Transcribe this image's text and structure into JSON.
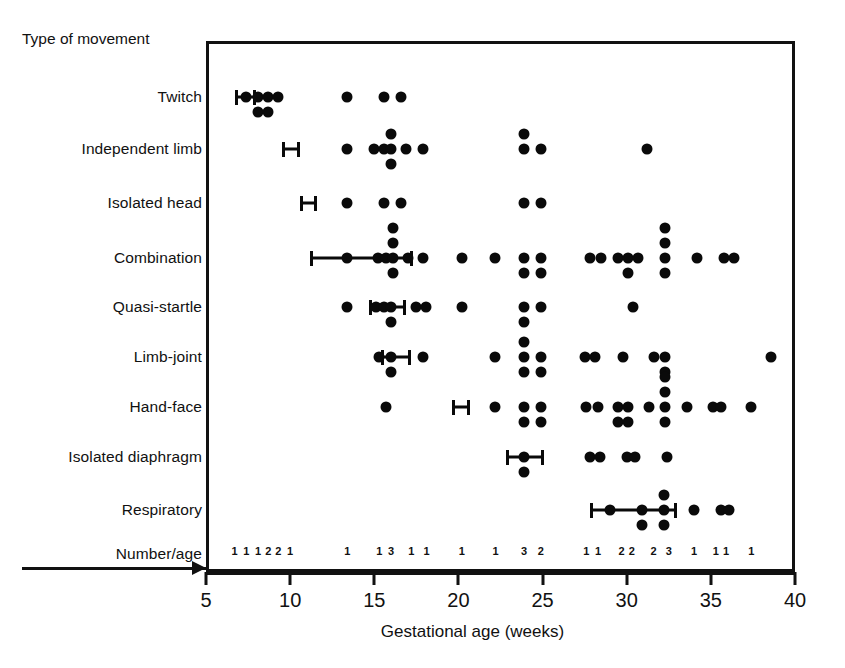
{
  "figure": {
    "column_header": "Type of movement",
    "numberage_label": "Number/age",
    "x_axis_title": "Gestational age (weeks)"
  },
  "chart_data": {
    "type": "scatter",
    "title": "",
    "xlabel": "Gestational age (weeks)",
    "ylabel": "Type of movement",
    "xlim": [
      5,
      40
    ],
    "xticks": [
      5,
      10,
      15,
      20,
      25,
      30,
      35,
      40
    ],
    "xticklabels": [
      "5",
      "10",
      "15",
      "20",
      "25",
      "30",
      "35",
      "40"
    ],
    "grid": false,
    "legend": null,
    "categories": [
      "Twitch",
      "Independent limb",
      "Isolated head",
      "Combination",
      "Quasi-startle",
      "Limb-joint",
      "Hand-face",
      "Isolated diaphragm",
      "Respiratory"
    ],
    "series": [
      {
        "name": "Twitch",
        "error_bar": {
          "low": 6.7,
          "high": 8.0,
          "mean": 7.4
        },
        "points": [
          {
            "x": 7.4,
            "stack": 0
          },
          {
            "x": 8.1,
            "stack": 0
          },
          {
            "x": 8.1,
            "stack": 1
          },
          {
            "x": 8.7,
            "stack": 0
          },
          {
            "x": 8.7,
            "stack": 1
          },
          {
            "x": 9.3,
            "stack": 0
          },
          {
            "x": 13.4,
            "stack": 0
          },
          {
            "x": 15.6,
            "stack": 0
          },
          {
            "x": 16.6,
            "stack": 0
          }
        ]
      },
      {
        "name": "Independent limb",
        "error_bar": {
          "low": 9.5,
          "high": 10.6,
          "mean": 10.0
        },
        "points": [
          {
            "x": 13.4,
            "stack": 0
          },
          {
            "x": 15.0,
            "stack": 0
          },
          {
            "x": 15.6,
            "stack": 0
          },
          {
            "x": 16.0,
            "stack": 0
          },
          {
            "x": 16.0,
            "stack": 1
          },
          {
            "x": 16.0,
            "stack": -1
          },
          {
            "x": 16.9,
            "stack": 0
          },
          {
            "x": 17.9,
            "stack": 0
          },
          {
            "x": 23.9,
            "stack": 0
          },
          {
            "x": 23.9,
            "stack": -1
          },
          {
            "x": 24.9,
            "stack": 0
          },
          {
            "x": 31.2,
            "stack": 0
          }
        ]
      },
      {
        "name": "Isolated head",
        "error_bar": {
          "low": 10.6,
          "high": 11.6,
          "mean": 11.1
        },
        "points": [
          {
            "x": 13.4,
            "stack": 0
          },
          {
            "x": 15.6,
            "stack": 0
          },
          {
            "x": 16.6,
            "stack": 0
          },
          {
            "x": 23.9,
            "stack": 0
          },
          {
            "x": 24.9,
            "stack": 0
          }
        ]
      },
      {
        "name": "Combination",
        "error_bar": {
          "low": 11.2,
          "high": 17.3,
          "mean": 13.9
        },
        "points": [
          {
            "x": 13.4,
            "stack": 0
          },
          {
            "x": 15.2,
            "stack": 0
          },
          {
            "x": 15.7,
            "stack": 0
          },
          {
            "x": 16.1,
            "stack": 0
          },
          {
            "x": 16.1,
            "stack": -1
          },
          {
            "x": 16.1,
            "stack": 1
          },
          {
            "x": 16.1,
            "stack": -2
          },
          {
            "x": 17.0,
            "stack": 0
          },
          {
            "x": 17.9,
            "stack": 0
          },
          {
            "x": 20.2,
            "stack": 0
          },
          {
            "x": 22.2,
            "stack": 0
          },
          {
            "x": 23.9,
            "stack": 0
          },
          {
            "x": 23.9,
            "stack": 1
          },
          {
            "x": 24.9,
            "stack": 0
          },
          {
            "x": 24.9,
            "stack": 1
          },
          {
            "x": 27.8,
            "stack": 0
          },
          {
            "x": 28.5,
            "stack": 0
          },
          {
            "x": 29.5,
            "stack": 0
          },
          {
            "x": 30.1,
            "stack": 0
          },
          {
            "x": 30.1,
            "stack": 1
          },
          {
            "x": 30.7,
            "stack": 0
          },
          {
            "x": 32.3,
            "stack": 0
          },
          {
            "x": 32.3,
            "stack": 1
          },
          {
            "x": 32.3,
            "stack": -1
          },
          {
            "x": 32.3,
            "stack": -2
          },
          {
            "x": 34.2,
            "stack": 0
          },
          {
            "x": 35.8,
            "stack": 0
          },
          {
            "x": 36.4,
            "stack": 0
          }
        ]
      },
      {
        "name": "Quasi-startle",
        "error_bar": {
          "low": 14.7,
          "high": 16.9,
          "mean": 15.7
        },
        "points": [
          {
            "x": 13.4,
            "stack": 0
          },
          {
            "x": 15.1,
            "stack": 0
          },
          {
            "x": 15.6,
            "stack": 0
          },
          {
            "x": 16.0,
            "stack": 0
          },
          {
            "x": 16.0,
            "stack": 1
          },
          {
            "x": 17.5,
            "stack": 0
          },
          {
            "x": 18.1,
            "stack": 0
          },
          {
            "x": 20.2,
            "stack": 0
          },
          {
            "x": 23.9,
            "stack": 0
          },
          {
            "x": 23.9,
            "stack": 1
          },
          {
            "x": 24.9,
            "stack": 0
          },
          {
            "x": 30.4,
            "stack": 0
          }
        ]
      },
      {
        "name": "Limb-joint",
        "error_bar": {
          "low": 15.4,
          "high": 17.2,
          "mean": 16.1
        },
        "points": [
          {
            "x": 15.3,
            "stack": 0
          },
          {
            "x": 16.0,
            "stack": 0
          },
          {
            "x": 16.0,
            "stack": 1
          },
          {
            "x": 17.9,
            "stack": 0
          },
          {
            "x": 22.2,
            "stack": 0
          },
          {
            "x": 23.9,
            "stack": 0
          },
          {
            "x": 23.9,
            "stack": 1
          },
          {
            "x": 23.9,
            "stack": -1
          },
          {
            "x": 24.9,
            "stack": 0
          },
          {
            "x": 24.9,
            "stack": 1
          },
          {
            "x": 27.5,
            "stack": 0
          },
          {
            "x": 28.1,
            "stack": 0
          },
          {
            "x": 29.8,
            "stack": 0
          },
          {
            "x": 31.6,
            "stack": 0
          },
          {
            "x": 32.3,
            "stack": 0
          },
          {
            "x": 32.3,
            "stack": 1
          },
          {
            "x": 38.6,
            "stack": 0
          }
        ]
      },
      {
        "name": "Hand-face",
        "error_bar": {
          "low": 19.6,
          "high": 20.7,
          "mean": 20.1
        },
        "points": [
          {
            "x": 15.7,
            "stack": 0
          },
          {
            "x": 22.2,
            "stack": 0
          },
          {
            "x": 23.9,
            "stack": 0
          },
          {
            "x": 23.9,
            "stack": 1
          },
          {
            "x": 24.9,
            "stack": 0
          },
          {
            "x": 24.9,
            "stack": 1
          },
          {
            "x": 27.6,
            "stack": 0
          },
          {
            "x": 28.3,
            "stack": 0
          },
          {
            "x": 29.5,
            "stack": 0
          },
          {
            "x": 29.5,
            "stack": 1
          },
          {
            "x": 30.1,
            "stack": 0
          },
          {
            "x": 30.1,
            "stack": 1
          },
          {
            "x": 31.3,
            "stack": 0
          },
          {
            "x": 32.3,
            "stack": 0
          },
          {
            "x": 32.3,
            "stack": 1
          },
          {
            "x": 32.3,
            "stack": -1
          },
          {
            "x": 32.3,
            "stack": -2
          },
          {
            "x": 33.6,
            "stack": 0
          },
          {
            "x": 35.1,
            "stack": 0
          },
          {
            "x": 35.6,
            "stack": 0
          },
          {
            "x": 37.4,
            "stack": 0
          }
        ]
      },
      {
        "name": "Isolated diaphragm",
        "error_bar": {
          "low": 22.8,
          "high": 25.1,
          "mean": 23.9
        },
        "points": [
          {
            "x": 23.9,
            "stack": 1
          },
          {
            "x": 23.9,
            "stack": 0
          },
          {
            "x": 27.8,
            "stack": 0
          },
          {
            "x": 28.4,
            "stack": 0
          },
          {
            "x": 30.0,
            "stack": 0
          },
          {
            "x": 30.5,
            "stack": 0
          },
          {
            "x": 32.4,
            "stack": 0
          }
        ]
      },
      {
        "name": "Respiratory",
        "error_bar": {
          "low": 27.8,
          "high": 33.0,
          "mean": 30.4
        },
        "points": [
          {
            "x": 29.0,
            "stack": 0
          },
          {
            "x": 30.9,
            "stack": 0
          },
          {
            "x": 30.9,
            "stack": 1
          },
          {
            "x": 32.2,
            "stack": 0
          },
          {
            "x": 32.2,
            "stack": 1
          },
          {
            "x": 32.2,
            "stack": -1
          },
          {
            "x": 34.0,
            "stack": 0
          },
          {
            "x": 35.6,
            "stack": 0
          },
          {
            "x": 36.1,
            "stack": 0
          }
        ]
      }
    ],
    "number_per_age": [
      {
        "x": 6.7,
        "count": "1"
      },
      {
        "x": 7.4,
        "count": "1"
      },
      {
        "x": 8.1,
        "count": "1"
      },
      {
        "x": 8.7,
        "count": "2"
      },
      {
        "x": 9.3,
        "count": "2"
      },
      {
        "x": 10.0,
        "count": "1"
      },
      {
        "x": 13.4,
        "count": "1"
      },
      {
        "x": 15.3,
        "count": "1"
      },
      {
        "x": 16.0,
        "count": "3"
      },
      {
        "x": 17.2,
        "count": "1"
      },
      {
        "x": 18.1,
        "count": "1"
      },
      {
        "x": 20.2,
        "count": "1"
      },
      {
        "x": 22.2,
        "count": "1"
      },
      {
        "x": 23.9,
        "count": "3"
      },
      {
        "x": 24.9,
        "count": "2"
      },
      {
        "x": 27.6,
        "count": "1"
      },
      {
        "x": 28.3,
        "count": "1"
      },
      {
        "x": 29.7,
        "count": "2"
      },
      {
        "x": 30.3,
        "count": "2"
      },
      {
        "x": 31.6,
        "count": "2"
      },
      {
        "x": 32.5,
        "count": "3"
      },
      {
        "x": 34.0,
        "count": "1"
      },
      {
        "x": 35.3,
        "count": "1"
      },
      {
        "x": 35.9,
        "count": "1"
      },
      {
        "x": 37.4,
        "count": "1"
      }
    ]
  }
}
